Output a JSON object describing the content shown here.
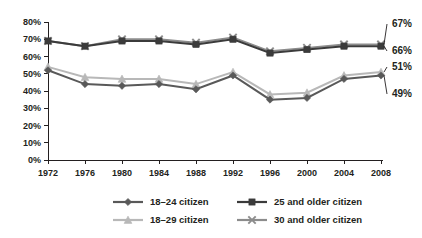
{
  "chart_data": {
    "type": "line",
    "title": "",
    "subtitle": "",
    "xlabel": "",
    "ylabel": "",
    "categories": [
      "1972",
      "1976",
      "1980",
      "1984",
      "1988",
      "1992",
      "1996",
      "2000",
      "2004",
      "2008"
    ],
    "x": [
      1972,
      1976,
      1980,
      1984,
      1988,
      1992,
      1996,
      2000,
      2004,
      2008
    ],
    "ylim": [
      0,
      80
    ],
    "yticks": [
      0,
      10,
      20,
      30,
      40,
      50,
      60,
      70,
      80
    ],
    "ytick_labels": [
      "0%",
      "10%",
      "20%",
      "30%",
      "40%",
      "50%",
      "60%",
      "70%",
      "80%"
    ],
    "grid": false,
    "legend_position": "bottom",
    "series": [
      {
        "name": "18–24 citizen",
        "marker": "diamond",
        "color": "#595959",
        "values": [
          52,
          44,
          43,
          44,
          41,
          49,
          35,
          36,
          47,
          49
        ],
        "end_label": "49%"
      },
      {
        "name": "25 and older citizen",
        "marker": "square",
        "color": "#3b3b3b",
        "values": [
          69,
          66,
          69,
          69,
          67,
          70,
          62,
          64,
          66,
          66
        ],
        "end_label": "66%"
      },
      {
        "name": "18–29 citizen",
        "marker": "triangle",
        "color": "#b8b8b8",
        "values": [
          54,
          48,
          47,
          47,
          44,
          51,
          38,
          39,
          49,
          51
        ],
        "end_label": "51%"
      },
      {
        "name": "30 and older citizen",
        "marker": "x",
        "color": "#8c8c8c",
        "values": [
          69,
          66,
          70,
          70,
          68,
          71,
          63,
          65,
          67,
          67
        ],
        "end_label": "67%"
      }
    ],
    "annotations": [
      {
        "text": "67%",
        "series": "30 and older citizen",
        "at": "2008"
      },
      {
        "text": "66%",
        "series": "25 and older citizen",
        "at": "2008"
      },
      {
        "text": "51%",
        "series": "18–29 citizen",
        "at": "2008"
      },
      {
        "text": "49%",
        "series": "18–24 citizen",
        "at": "2008"
      }
    ]
  },
  "legend": {
    "items": [
      {
        "label": "18–24 citizen",
        "marker": "diamond-icon",
        "color": "#595959"
      },
      {
        "label": "25 and older citizen",
        "marker": "square-icon",
        "color": "#3b3b3b"
      },
      {
        "label": "18–29 citizen",
        "marker": "triangle-icon",
        "color": "#b8b8b8"
      },
      {
        "label": "30 and older citizen",
        "marker": "x-icon",
        "color": "#8c8c8c"
      }
    ]
  },
  "axis": {
    "y_labels": [
      "80%",
      "70%",
      "60%",
      "50%",
      "40%",
      "30%",
      "20%",
      "10%",
      "0%"
    ],
    "x_labels": [
      "1972",
      "1976",
      "1980",
      "1984",
      "1988",
      "1992",
      "1996",
      "2000",
      "2004",
      "2008"
    ]
  }
}
